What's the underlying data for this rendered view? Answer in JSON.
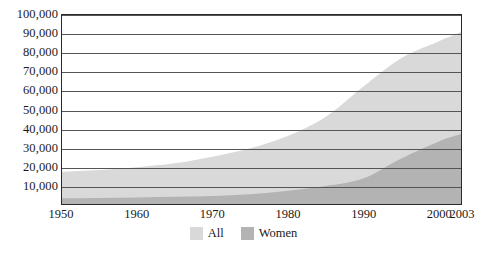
{
  "chart_data": {
    "type": "area",
    "title": "",
    "subtitle": "",
    "xlabel": "",
    "ylabel": "",
    "xlim": [
      1950,
      2003
    ],
    "ylim": [
      0,
      100000
    ],
    "grid": true,
    "legend_position": "bottom-center",
    "x_ticks": [
      "1950",
      "1960",
      "1970",
      "1980",
      "1990",
      "2000",
      "2003"
    ],
    "x_tick_values": [
      1950,
      1960,
      1970,
      1980,
      1990,
      2000,
      2003
    ],
    "y_ticks": [
      "10,000",
      "20,000",
      "30,000",
      "40,000",
      "50,000",
      "60,000",
      "70,000",
      "80,000",
      "90,000",
      "100,000"
    ],
    "y_tick_values": [
      10000,
      20000,
      30000,
      40000,
      50000,
      60000,
      70000,
      80000,
      90000,
      100000
    ],
    "x": [
      1950,
      1955,
      1960,
      1965,
      1970,
      1975,
      1980,
      1985,
      1990,
      1995,
      2000,
      2003
    ],
    "series": [
      {
        "name": "All",
        "color": "#d9d9d9",
        "values": [
          17000,
          18000,
          19500,
          21500,
          25000,
          29500,
          36000,
          46000,
          62000,
          77000,
          86000,
          91000
        ]
      },
      {
        "name": "Women",
        "color": "#b3b3b3",
        "values": [
          3000,
          3200,
          3500,
          3800,
          4300,
          5200,
          7000,
          9500,
          13500,
          24000,
          33000,
          37000
        ]
      }
    ],
    "legend": [
      {
        "label": "All",
        "color": "#d9d9d9"
      },
      {
        "label": "Women",
        "color": "#b3b3b3"
      }
    ]
  },
  "colors": {
    "all_area": "#d9d9d9",
    "women_area": "#b3b3b3",
    "gridline": "#555555",
    "frame": "#2b2b2b",
    "background": "#ffffff",
    "text": "#1a1a1a"
  }
}
